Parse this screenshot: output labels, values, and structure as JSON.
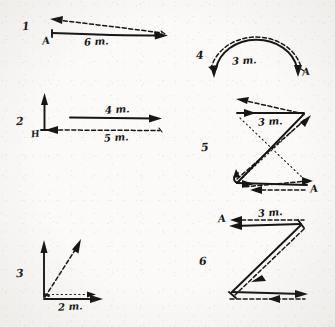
{
  "page": {
    "background_color": "#fbfaf8",
    "ink_color": "#161616",
    "width": 335,
    "height": 327
  },
  "figures": [
    {
      "number": "1",
      "labels": {
        "start_point": "A",
        "dimension": "6 m."
      },
      "description": "Long solid arrow pointing right from A, with a dashed return arrow above pointing left",
      "strokes": [
        "solid-right-arrow",
        "dashed-left-arrow"
      ]
    },
    {
      "number": "2",
      "labels": {
        "start_point": "H",
        "dimension_solid": "4 m.",
        "dimension_dashed": "5 m."
      },
      "description": "Vertical solid arrow up at H, solid horizontal arrow right labeled 4 m., dashed horizontal arrow left labeled 5 m.",
      "strokes": [
        "vertical-up-arrow",
        "solid-right-arrow",
        "dashed-left-arrow"
      ]
    },
    {
      "number": "3",
      "labels": {
        "dimension": "2 m."
      },
      "description": "Vertical solid arrow up, diagonal dashed arrow up-right, horizontal solid arrow right labeled 2 m.",
      "strokes": [
        "vertical-up-arrow",
        "dashed-diagonal-arrow",
        "solid-right-arrow",
        "dotted-horizontal-arrow"
      ]
    },
    {
      "number": "4",
      "labels": {
        "end_point": "A",
        "dimension": "3 m."
      },
      "description": "Semicircular solid arc with arrowheads at both lower ends, dashed arc above, labeled 3 m.",
      "strokes": [
        "solid-arc",
        "dashed-arc"
      ]
    },
    {
      "number": "5",
      "labels": {
        "end_point": "A",
        "dimension": "3 m."
      },
      "description": "Z-shaped path of solid arrows with dashed overlay and dotted cross lines",
      "strokes": [
        "solid-z-path",
        "dashed-z-path",
        "dotted-cross-lines"
      ]
    },
    {
      "number": "6",
      "labels": {
        "start_point": "A",
        "dimension": "3 m."
      },
      "description": "Z-shaped path of solid arrows with dashed overlay, A at top left, labeled 3 m.",
      "strokes": [
        "solid-z-path",
        "dashed-z-path"
      ]
    }
  ]
}
